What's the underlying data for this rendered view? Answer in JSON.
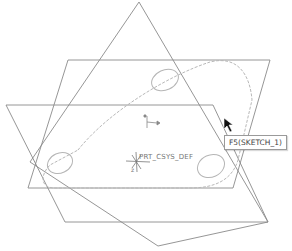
{
  "viewport": {
    "background": "#ffffff",
    "plane_color": "#8a8a8a",
    "sketch_color": "#b8b8b8"
  },
  "datum_planes": [
    {
      "name": "plane-a",
      "points": "68,60 270,60 233,188 28,188"
    },
    {
      "name": "plane-b",
      "points": "6,105 213,105 268,222 65,222"
    },
    {
      "name": "plane-c",
      "points": "139,2 268,222 158,246 30,162"
    }
  ],
  "sketch": {
    "outline": "M 78,150 C 110,110 170,75 210,62 C 238,55 250,75 252,100 L 238,160 C 232,180 215,188 190,188 L 55,188 C 40,188 40,175 50,165 Z",
    "holes": [
      {
        "cx": 60,
        "cy": 163,
        "rx": 13,
        "ry": 10
      },
      {
        "cx": 165,
        "cy": 80,
        "rx": 14,
        "ry": 10
      },
      {
        "cx": 211,
        "cy": 166,
        "rx": 14,
        "ry": 11
      }
    ]
  },
  "csys": {
    "label": "PRT_CSYS_DEF",
    "axis_z": "z"
  },
  "tooltip": {
    "text": "F5(SKETCH_1)"
  },
  "cursor": {
    "icon": "arrow-cursor-icon"
  }
}
